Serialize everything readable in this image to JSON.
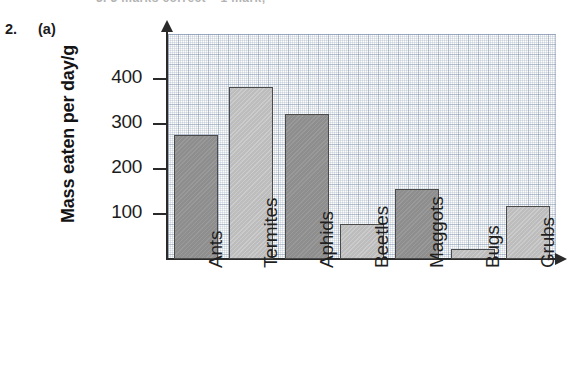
{
  "page": {
    "cut_off_header_text": "3. 3 marks correct – 1 mark;",
    "question_number": "2.",
    "question_part": "(a)"
  },
  "chart_data": {
    "type": "bar",
    "title": "",
    "xlabel": "",
    "ylabel": "Mass eaten per day/g",
    "categories": [
      "Ants",
      "Termites",
      "Aphids",
      "Beetles",
      "Maggots",
      "Bugs",
      "Grubs"
    ],
    "values": [
      275,
      383,
      322,
      78,
      155,
      22,
      118
    ],
    "ytick_labels": [
      "100",
      "200",
      "300",
      "400"
    ],
    "ytick_values": [
      100,
      200,
      300,
      400
    ],
    "ylim": [
      0,
      500
    ],
    "grid": true,
    "legend": "none",
    "bar_colors": [
      "#8e8e8e",
      "#bdbdbd",
      "#8e8e8e",
      "#bdbdbd",
      "#8e8e8e",
      "#bdbdbd",
      "#bdbdbd"
    ],
    "bar_shade_names": [
      "dark",
      "light",
      "dark",
      "light",
      "dark",
      "light",
      "light"
    ],
    "axis_color": "#2a2a2a",
    "grid_color": "#788aaa",
    "plot_background": "#fdfdfb"
  }
}
